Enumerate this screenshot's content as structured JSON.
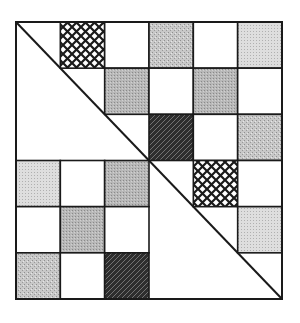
{
  "figure": {
    "grid": {
      "rows": 6,
      "cols": 6,
      "left": 16,
      "top": 22,
      "width": 266,
      "height": 277
    },
    "colors": {
      "line": "#1a1a1a",
      "white": "#ffffff",
      "light_gray": "#dcdcdc",
      "medium_gray": "#b4b4b4",
      "textured_gray": "#c6c6c6",
      "dark_hatch_bg": "#3a3a3a"
    },
    "cells": [
      {
        "r": 0,
        "c": 1,
        "fill": "crosshatch"
      },
      {
        "r": 0,
        "c": 2,
        "fill": "white"
      },
      {
        "r": 0,
        "c": 3,
        "fill": "textured_gray"
      },
      {
        "r": 0,
        "c": 4,
        "fill": "white"
      },
      {
        "r": 0,
        "c": 5,
        "fill": "light_gray"
      },
      {
        "r": 1,
        "c": 2,
        "fill": "medium_gray"
      },
      {
        "r": 1,
        "c": 3,
        "fill": "white"
      },
      {
        "r": 1,
        "c": 4,
        "fill": "medium_gray"
      },
      {
        "r": 1,
        "c": 5,
        "fill": "white"
      },
      {
        "r": 2,
        "c": 3,
        "fill": "dark_hatch"
      },
      {
        "r": 2,
        "c": 4,
        "fill": "white"
      },
      {
        "r": 2,
        "c": 5,
        "fill": "textured_gray"
      },
      {
        "r": 3,
        "c": 0,
        "fill": "light_gray"
      },
      {
        "r": 3,
        "c": 1,
        "fill": "white"
      },
      {
        "r": 3,
        "c": 2,
        "fill": "medium_gray"
      },
      {
        "r": 3,
        "c": 4,
        "fill": "crosshatch"
      },
      {
        "r": 3,
        "c": 5,
        "fill": "white"
      },
      {
        "r": 4,
        "c": 0,
        "fill": "white"
      },
      {
        "r": 4,
        "c": 1,
        "fill": "medium_gray"
      },
      {
        "r": 4,
        "c": 2,
        "fill": "white"
      },
      {
        "r": 4,
        "c": 5,
        "fill": "light_gray"
      },
      {
        "r": 5,
        "c": 0,
        "fill": "textured_gray"
      },
      {
        "r": 5,
        "c": 1,
        "fill": "white"
      },
      {
        "r": 5,
        "c": 2,
        "fill": "dark_hatch"
      }
    ],
    "diagonal": {
      "from": "top-left",
      "to": "bottom-right"
    }
  }
}
